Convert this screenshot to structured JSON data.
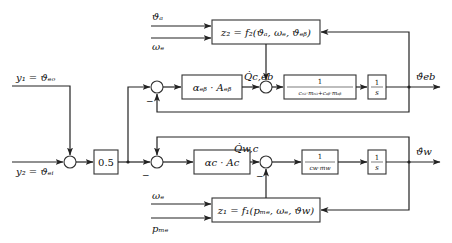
{
  "diagram": {
    "type": "block-diagram",
    "inputs": {
      "y1": "y₁ = ϑₑₒ",
      "y2": "y₂ = ϑₑᵢ",
      "theta_a": "ϑₐ",
      "omega_e_top": "ωₑ",
      "omega_e_bottom": "ωₑ",
      "p_me": "pₘₑ"
    },
    "blocks": {
      "z2": "z₂ = f₂(ϑₐ, ωₑ, ϑₑᵦ)",
      "z1": "z₁ = f₁(pₘₑ, ωₑ, ϑw)",
      "gain": "0.5",
      "alpha_eb": "αₑᵦ · Aₑᵦ",
      "alpha_c": "αc · Ac",
      "inv_mass_eb_num": "1",
      "inv_mass_eb_den": "cₒᵢₗ·mₒᵢₗ+cₑᵦ·mₑᵦ",
      "inv_mass_w_num": "1",
      "inv_mass_w_den": "cw·mw",
      "integrator_top_num": "1",
      "integrator_top_den": "s",
      "integrator_bottom_num": "1",
      "integrator_bottom_den": "s"
    },
    "signals": {
      "q_c_eb": "Q̇c,eb",
      "q_w_c": "Q̇w,c"
    },
    "outputs": {
      "theta_eb": "ϑ̂eb",
      "theta_w": "ϑ̂w"
    },
    "signs": {
      "upper_feedback": "−",
      "lower_feedback": "−",
      "lower_z1": "−"
    }
  }
}
